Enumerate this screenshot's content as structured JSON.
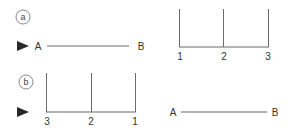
{
  "colors": {
    "line": "#6b6b6b",
    "text": "#333333",
    "arrow": "#2a2a2a",
    "circle": "#888888"
  },
  "panel_a": {
    "marker": "a",
    "marker_icon": "arrow-right-icon",
    "segment": {
      "start_label": "A",
      "end_label": "B"
    },
    "scale": {
      "tick_labels": [
        "1",
        "2",
        "3"
      ]
    }
  },
  "panel_b": {
    "marker": "b",
    "marker_icon": "arrow-right-icon",
    "scale": {
      "tick_labels": [
        "3",
        "2",
        "1"
      ]
    },
    "segment": {
      "start_label": "A",
      "end_label": "B"
    }
  }
}
